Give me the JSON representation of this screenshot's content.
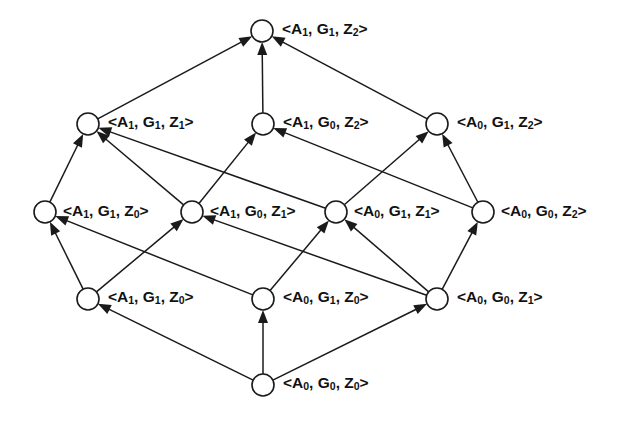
{
  "diagram": {
    "background_color": "#ffffff",
    "stroke_color": "#1a1a1a",
    "node_fill_color": "#ffffff",
    "node_radius": 11,
    "width": 635,
    "height": 422,
    "arrow_style": "filled-triangle",
    "nodes": [
      {
        "id": "n_A1G1Z2",
        "label": "<A1, G1, Z2>",
        "a": "1",
        "g": "1",
        "z": "2",
        "x": 262,
        "y": 31,
        "level": 5,
        "label_x": 282,
        "label_y": 29
      },
      {
        "id": "n_A1G1Z1",
        "label": "<A1, G1, Z1>",
        "a": "1",
        "g": "1",
        "z": "1",
        "x": 88,
        "y": 124,
        "level": 4,
        "label_x": 108,
        "label_y": 122
      },
      {
        "id": "n_A1G0Z2",
        "label": "<A1, G0, Z2>",
        "a": "1",
        "g": "0",
        "z": "2",
        "x": 263,
        "y": 124,
        "level": 4,
        "label_x": 283,
        "label_y": 122
      },
      {
        "id": "n_A0G1Z2",
        "label": "<A0, G1, Z2>",
        "a": "0",
        "g": "1",
        "z": "2",
        "x": 437,
        "y": 124,
        "level": 4,
        "label_x": 457,
        "label_y": 122
      },
      {
        "id": "n_A1G1Z0m",
        "label": "<A1, G1, Z0>",
        "a": "1",
        "g": "1",
        "z": "0",
        "x": 45,
        "y": 212,
        "level": 3,
        "label_x": 63,
        "label_y": 211
      },
      {
        "id": "n_A1G0Z1",
        "label": "<A1, G0, Z1>",
        "a": "1",
        "g": "0",
        "z": "1",
        "x": 192,
        "y": 212,
        "level": 3,
        "label_x": 210,
        "label_y": 211
      },
      {
        "id": "n_A0G1Z1",
        "label": "<A0, G1, Z1>",
        "a": "0",
        "g": "1",
        "z": "1",
        "x": 336,
        "y": 212,
        "level": 3,
        "label_x": 354,
        "label_y": 211
      },
      {
        "id": "n_A0G0Z2",
        "label": "<A0, G0, Z2>",
        "a": "0",
        "g": "0",
        "z": "2",
        "x": 483,
        "y": 212,
        "level": 3,
        "label_x": 501,
        "label_y": 211
      },
      {
        "id": "n_A1G1Z0b",
        "label": "<A1, G1, Z0>",
        "a": "1",
        "g": "1",
        "z": "0",
        "x": 88,
        "y": 299,
        "level": 2,
        "label_x": 108,
        "label_y": 297
      },
      {
        "id": "n_A0G1Z0",
        "label": "<A0, G1, Z0>",
        "a": "0",
        "g": "1",
        "z": "0",
        "x": 263,
        "y": 299,
        "level": 2,
        "label_x": 283,
        "label_y": 297
      },
      {
        "id": "n_A0G0Z1",
        "label": "<A0, G0, Z1>",
        "a": "0",
        "g": "0",
        "z": "1",
        "x": 437,
        "y": 299,
        "level": 2,
        "label_x": 457,
        "label_y": 297
      },
      {
        "id": "n_A0G0Z0",
        "label": "<A0, G0, Z0>",
        "a": "0",
        "g": "0",
        "z": "0",
        "x": 263,
        "y": 385,
        "level": 1,
        "label_x": 283,
        "label_y": 383
      }
    ],
    "edges": [
      {
        "from": "n_A0G0Z0",
        "to": "n_A1G1Z0b"
      },
      {
        "from": "n_A0G0Z0",
        "to": "n_A0G1Z0"
      },
      {
        "from": "n_A0G0Z0",
        "to": "n_A0G0Z1"
      },
      {
        "from": "n_A1G1Z0b",
        "to": "n_A1G1Z0m"
      },
      {
        "from": "n_A1G1Z0b",
        "to": "n_A1G0Z1"
      },
      {
        "from": "n_A0G1Z0",
        "to": "n_A1G1Z0m"
      },
      {
        "from": "n_A0G1Z0",
        "to": "n_A0G1Z1"
      },
      {
        "from": "n_A0G0Z1",
        "to": "n_A1G0Z1"
      },
      {
        "from": "n_A0G0Z1",
        "to": "n_A0G1Z1"
      },
      {
        "from": "n_A0G0Z1",
        "to": "n_A0G0Z2"
      },
      {
        "from": "n_A1G1Z0m",
        "to": "n_A1G1Z1"
      },
      {
        "from": "n_A1G0Z1",
        "to": "n_A1G1Z1"
      },
      {
        "from": "n_A1G0Z1",
        "to": "n_A1G0Z2"
      },
      {
        "from": "n_A0G1Z1",
        "to": "n_A1G1Z1"
      },
      {
        "from": "n_A0G1Z1",
        "to": "n_A0G1Z2"
      },
      {
        "from": "n_A0G0Z2",
        "to": "n_A1G0Z2"
      },
      {
        "from": "n_A0G0Z2",
        "to": "n_A0G1Z2"
      },
      {
        "from": "n_A1G1Z1",
        "to": "n_A1G1Z2"
      },
      {
        "from": "n_A1G0Z2",
        "to": "n_A1G1Z2"
      },
      {
        "from": "n_A0G1Z2",
        "to": "n_A1G1Z2"
      }
    ]
  }
}
